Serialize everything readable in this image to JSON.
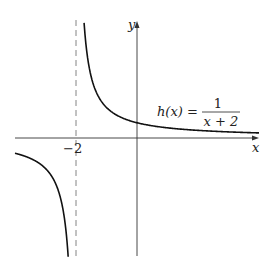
{
  "chart_data": {
    "type": "line",
    "title": "",
    "function_label": "h(x) = 1/(x+2)",
    "function_name": "h(x)",
    "equals": "=",
    "numerator": "1",
    "denominator": "x + 2",
    "xlabel": "x",
    "ylabel": "y",
    "x_ticks": [
      {
        "value": -2,
        "label": "−2"
      }
    ],
    "vertical_asymptote": {
      "x": -2,
      "style": "dashed"
    },
    "horizontal_asymptote": {
      "y": 0
    },
    "xlim": [
      -4,
      4
    ],
    "ylim": [
      -4,
      4.5
    ],
    "grid": false,
    "series": [
      {
        "name": "h(x) = 1/(x+2), right branch",
        "x": [
          -1.75,
          -1.6,
          -1.5,
          -1.25,
          -1,
          -0.5,
          0,
          1,
          2,
          3,
          4
        ],
        "y": [
          4,
          2.5,
          2,
          1.333,
          1,
          0.667,
          0.5,
          0.333,
          0.25,
          0.2,
          0.167
        ]
      },
      {
        "name": "h(x) = 1/(x+2), left branch",
        "x": [
          -4,
          -3.5,
          -3,
          -2.75,
          -2.5,
          -2.25
        ],
        "y": [
          -0.5,
          -0.667,
          -1,
          -1.333,
          -2,
          -4
        ]
      }
    ]
  },
  "labels": {
    "x_axis": "x",
    "y_axis": "y",
    "tick_minus_two": "−2",
    "func_name": "h(x) =",
    "numerator": "1",
    "denominator": "x + 2"
  },
  "colors": {
    "curve": "#111111",
    "axis": "#333333",
    "asymptote": "#777777"
  }
}
